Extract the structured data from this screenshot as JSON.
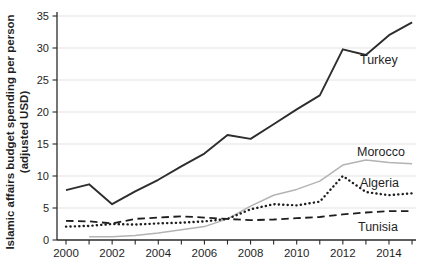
{
  "figure": {
    "width": 422,
    "height": 276,
    "background": "#ffffff",
    "text_color": "#1f1f1f",
    "grid_color": "#e3e3e3",
    "axis_color": "#2a2a2a"
  },
  "chart_data": {
    "type": "line",
    "title": "",
    "xlabel": "",
    "ylabel_line1": "Islamic affairs budget spending per person",
    "ylabel_line2": "(adjusted USD)",
    "x": [
      2000,
      2001,
      2002,
      2003,
      2004,
      2005,
      2006,
      2007,
      2008,
      2009,
      2010,
      2011,
      2012,
      2013,
      2014,
      2015
    ],
    "x_major_tick_labels": [
      "2000",
      "2002",
      "2004",
      "2006",
      "2008",
      "2010",
      "2012",
      "2014"
    ],
    "ylim": [
      0,
      35
    ],
    "y_ticks": [
      0,
      5,
      10,
      15,
      20,
      25,
      30,
      35
    ],
    "grid": "horizontal-only",
    "legend": "inline-labels",
    "series": [
      {
        "name": "Turkey",
        "line_style": "solid-dark",
        "color": "#2d2d2d",
        "values": [
          7.8,
          8.7,
          5.6,
          7.6,
          9.4,
          11.5,
          13.5,
          16.4,
          15.8,
          18.1,
          20.4,
          22.6,
          29.8,
          28.9,
          32.0,
          34.0
        ],
        "label": {
          "text": "Turkey",
          "x": 360,
          "y": 64
        }
      },
      {
        "name": "Morocco",
        "line_style": "solid-light",
        "color": "#b3b3b3",
        "values": [
          null,
          0.5,
          0.5,
          0.7,
          1.1,
          1.6,
          2.1,
          3.3,
          5.3,
          7.0,
          7.9,
          9.2,
          11.7,
          12.5,
          12.1,
          11.9
        ],
        "label": {
          "text": "Morocco",
          "x": 357,
          "y": 156
        }
      },
      {
        "name": "Algeria",
        "line_style": "dotted",
        "color": "#1e1e1e",
        "values": [
          2.1,
          2.2,
          2.5,
          2.4,
          2.6,
          2.7,
          2.9,
          3.3,
          4.8,
          5.6,
          5.4,
          6.0,
          10.0,
          7.5,
          7.0,
          7.3
        ],
        "label": {
          "text": "Algeria",
          "x": 360,
          "y": 187
        }
      },
      {
        "name": "Tunisia",
        "line_style": "dashed",
        "color": "#1e1e1e",
        "values": [
          3.0,
          2.9,
          2.6,
          3.3,
          3.5,
          3.7,
          3.5,
          3.3,
          3.1,
          3.2,
          3.4,
          3.6,
          4.0,
          4.3,
          4.5,
          4.5
        ],
        "label": {
          "text": "Tunisia",
          "x": 358,
          "y": 231
        }
      }
    ]
  }
}
